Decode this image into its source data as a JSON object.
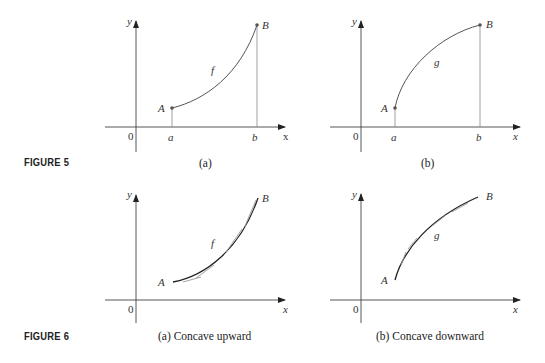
{
  "figures": [
    {
      "label": "FIGURE 5",
      "panels": [
        {
          "caption": "(a)",
          "function": "f",
          "start_point": "A",
          "end_point": "B",
          "x_ticks": [
            "a",
            "b"
          ],
          "origin": "0",
          "x_axis": "x",
          "y_axis": "y",
          "shape": "increasing, concave upward"
        },
        {
          "caption": "(b)",
          "function": "g",
          "start_point": "A",
          "end_point": "B",
          "x_ticks": [
            "a",
            "b"
          ],
          "origin": "0",
          "x_axis": "x",
          "y_axis": "y",
          "shape": "increasing, concave downward"
        }
      ]
    },
    {
      "label": "FIGURE 6",
      "panels": [
        {
          "caption": "(a) Concave upward",
          "function": "f",
          "start_point": "A",
          "end_point": "B",
          "origin": "0",
          "x_axis": "x",
          "y_axis": "y",
          "tangent_lines": "below curve"
        },
        {
          "caption": "(b) Concave downward",
          "function": "g",
          "start_point": "A",
          "end_point": "B",
          "origin": "0",
          "x_axis": "x",
          "y_axis": "y",
          "tangent_lines": "above curve"
        }
      ]
    }
  ],
  "colors": {
    "curve": "#555555",
    "curve_dark": "#222222",
    "axis": "#444444",
    "tangent": "#999999",
    "guide": "#888888"
  }
}
